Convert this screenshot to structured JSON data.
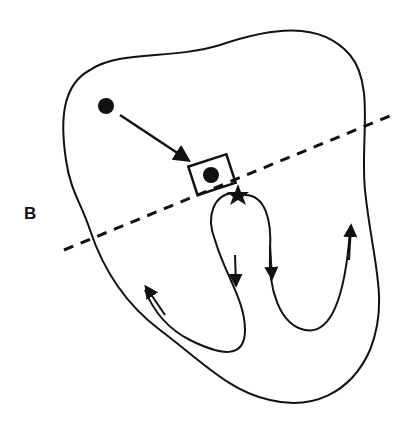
{
  "diagram": {
    "type": "heart conduction schematic",
    "panel_label": "B",
    "elements": {
      "heart_outline": "closed irregular outline",
      "origin_dot": "filled circle (upper left)",
      "target_box": "rectangle containing filled circle",
      "star": "six-point star below box",
      "dashed_line": "dashed plane line crossing diagonally",
      "loops": [
        "left loop with arrows down/up",
        "right loop with arrows down/up"
      ]
    },
    "colors": {
      "stroke": "#111111",
      "background": "#ffffff"
    }
  }
}
